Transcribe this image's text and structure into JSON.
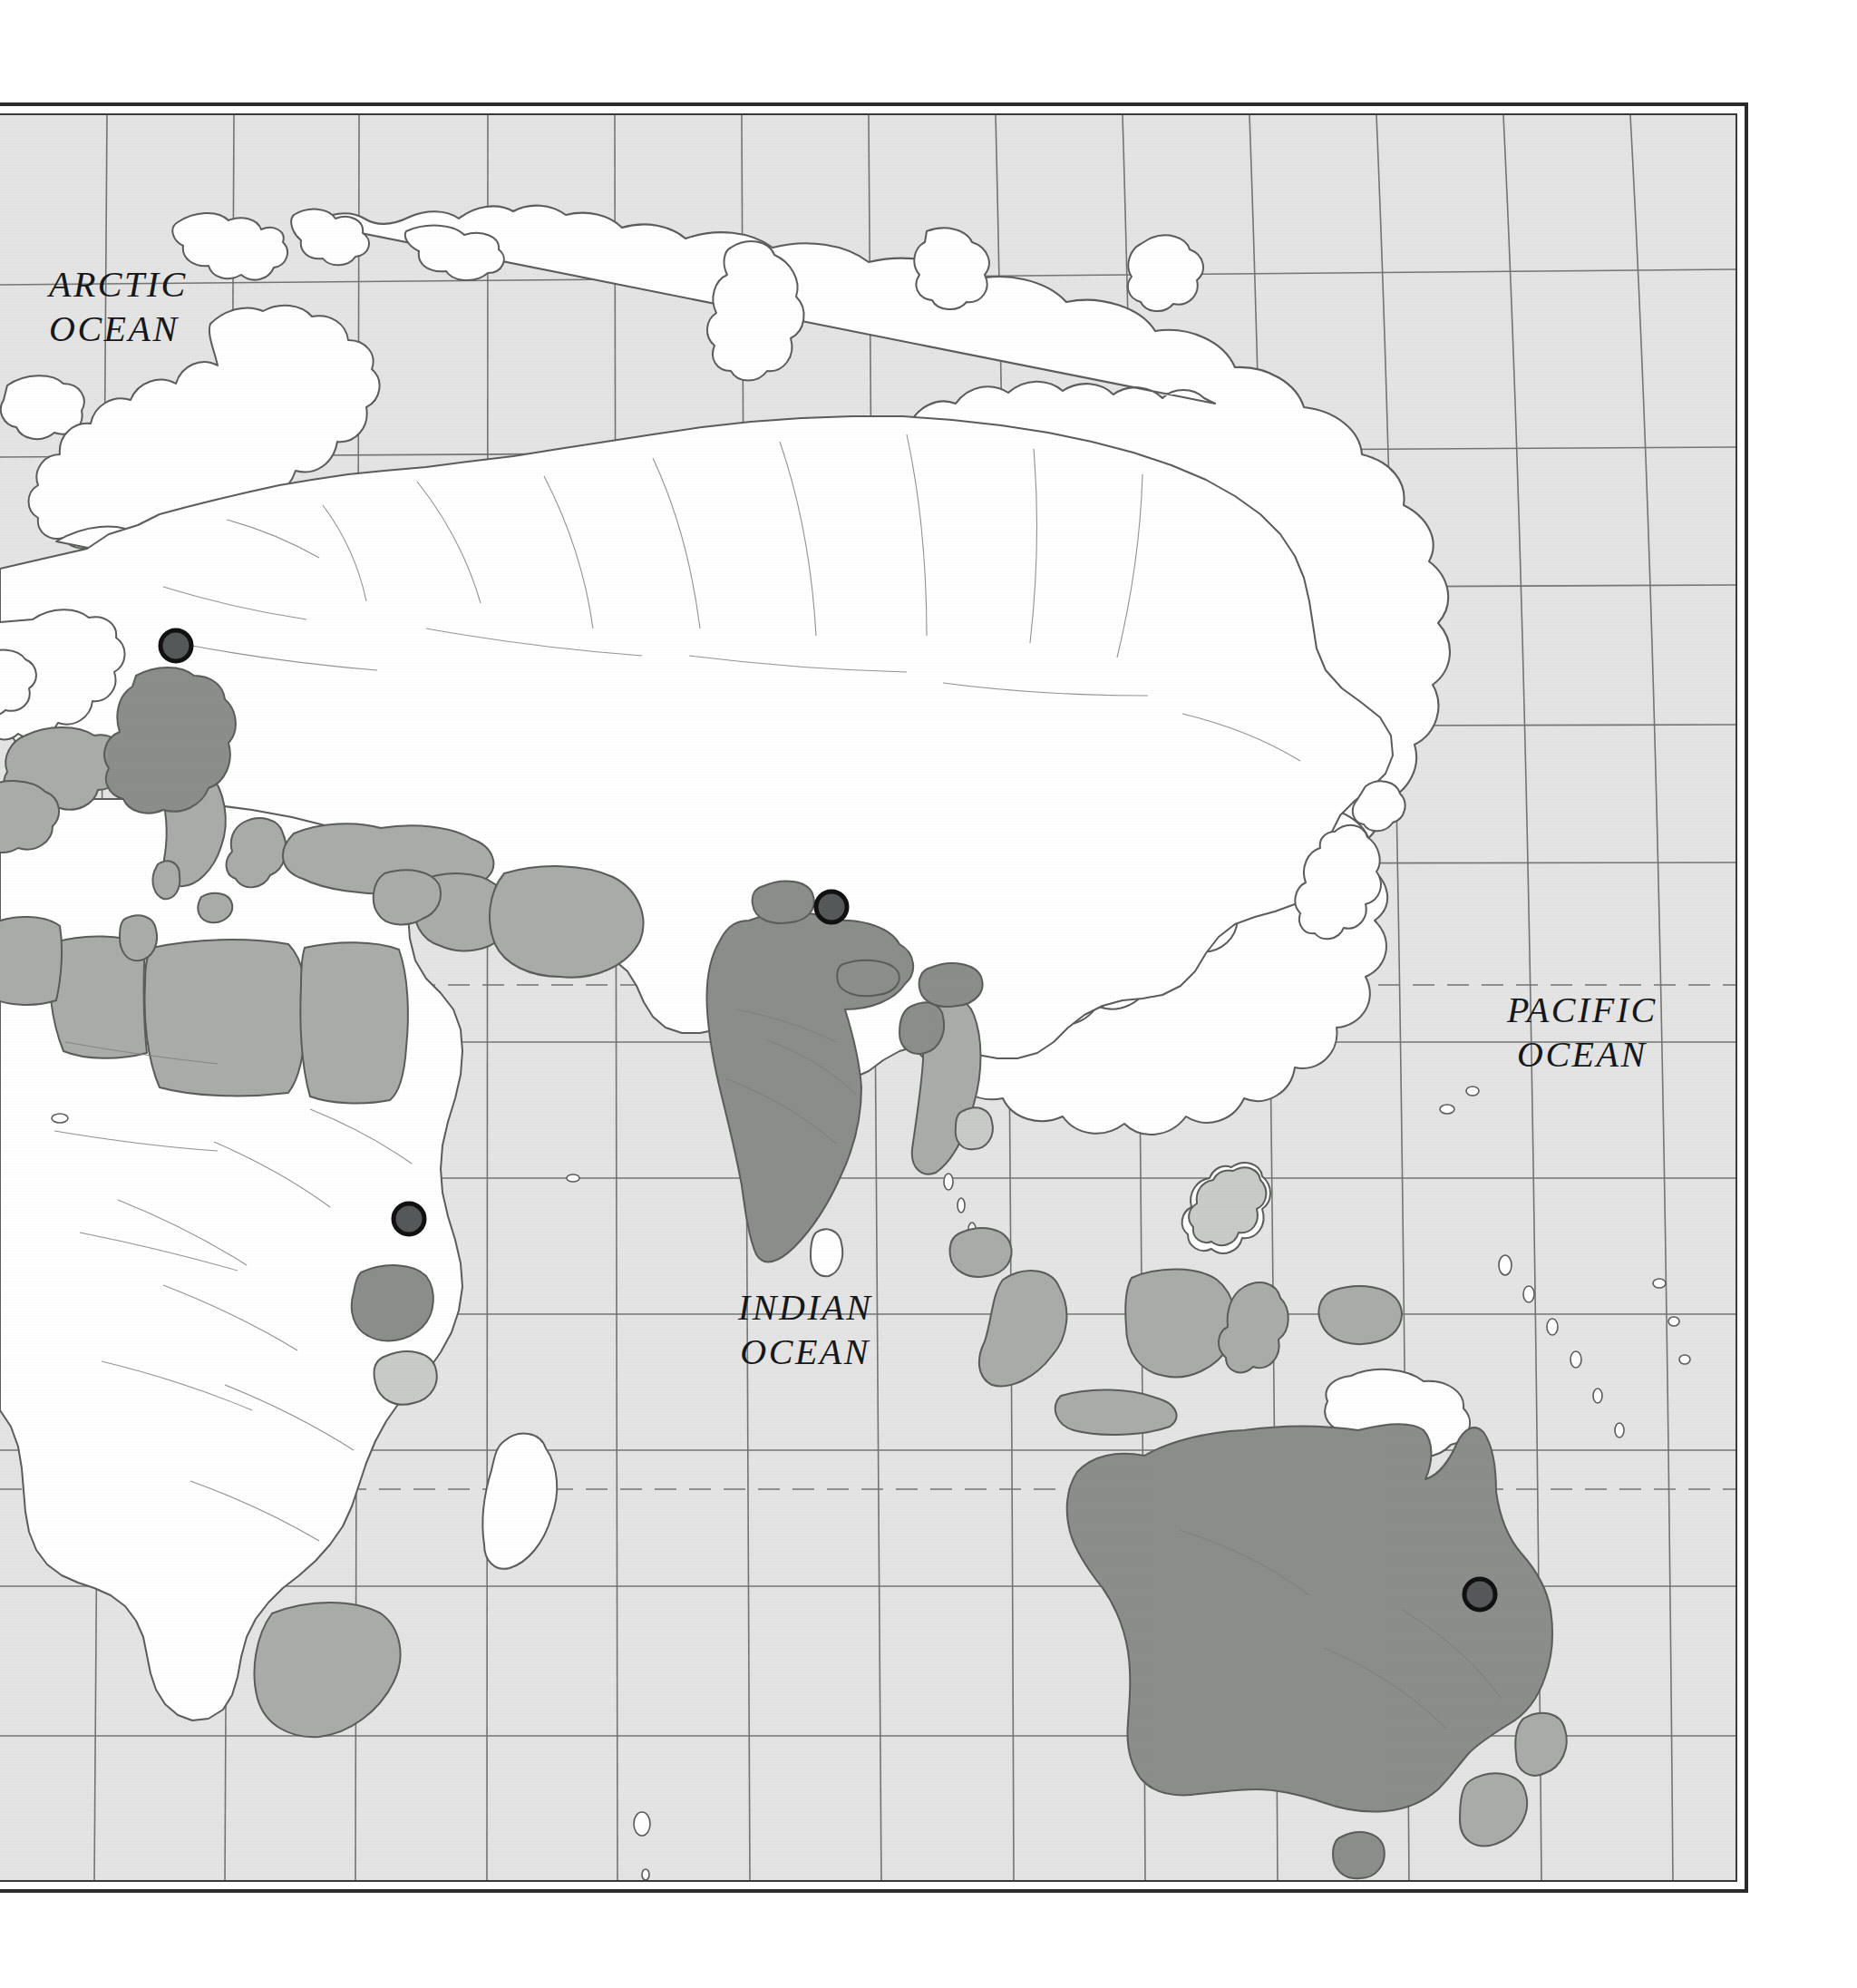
{
  "figure": {
    "kind": "world-map",
    "hemisphere": "Eastern Hemisphere",
    "projection": "pseudo-cylindrical (Robinson-like)"
  },
  "ocean_labels": [
    {
      "id": "arctic",
      "line1": "ARCTIC",
      "line2": "OCEAN",
      "x": 40,
      "y": 290
    },
    {
      "id": "pacific",
      "line1": "PACIFIC",
      "line2": "OCEAN",
      "x": 1648,
      "y": 1090
    },
    {
      "id": "indian",
      "line1": "INDIAN",
      "line2": "OCEAN",
      "x": 800,
      "y": 1418
    }
  ],
  "legend_colors": {
    "ocean": "#e3e4e3",
    "land_unshaded": "#ffffff",
    "land_light_shade": "#c9cbc9",
    "land_mid_shade": "#a9aca9",
    "land_dark_shade": "#8b8e8b",
    "coastline": "#5a5d5a",
    "graticule": "#6e716e",
    "frame": "#2b2b2b",
    "marker_fill": "#55595a",
    "marker_stroke": "#111111"
  },
  "highlighted_countries": [
    {
      "name": "Germany",
      "shade": "dark"
    },
    {
      "name": "India",
      "shade": "dark"
    },
    {
      "name": "Uganda",
      "shade": "dark"
    },
    {
      "name": "Australia",
      "shade": "dark"
    },
    {
      "name": "Bangladesh",
      "shade": "dark"
    },
    {
      "name": "Turkey",
      "shade": "mid"
    },
    {
      "name": "Iraq",
      "shade": "mid"
    },
    {
      "name": "Iran",
      "shade": "mid"
    },
    {
      "name": "Libya",
      "shade": "mid"
    },
    {
      "name": "Egypt",
      "shade": "mid"
    },
    {
      "name": "Italy",
      "shade": "mid"
    },
    {
      "name": "France",
      "shade": "mid"
    },
    {
      "name": "Indonesia",
      "shade": "mid"
    },
    {
      "name": "Malaysia",
      "shade": "mid"
    },
    {
      "name": "Myanmar",
      "shade": "mid"
    },
    {
      "name": "South Africa",
      "shade": "mid"
    },
    {
      "name": "New Zealand",
      "shade": "mid"
    },
    {
      "name": "Philippines",
      "shade": "light"
    }
  ],
  "city_markers": [
    {
      "id": "marker-germany",
      "label": "Germany",
      "x": 180,
      "y": 712
    },
    {
      "id": "marker-india",
      "label": "India",
      "x": 903,
      "y": 1000
    },
    {
      "id": "marker-uganda",
      "label": "Uganda",
      "x": 437,
      "y": 1344
    },
    {
      "id": "marker-australia",
      "label": "Australia",
      "x": 1618,
      "y": 1758
    }
  ],
  "graticule": {
    "parallels_px": [
      300,
      490,
      640,
      790,
      940,
      1135,
      1285,
      1435,
      1585,
      1735,
      1900
    ],
    "dashed_parallels_px": [
      1072,
      1628
    ],
    "meridian_count": 13,
    "dashed_note": "Tropic of Cancer and Tropic of Capricorn drawn dashed"
  }
}
